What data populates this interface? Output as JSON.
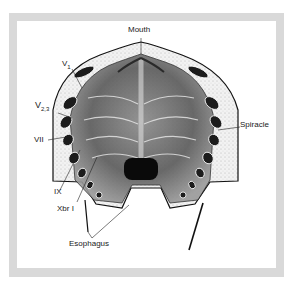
{
  "figure": {
    "frame_color": "#d9d9d9",
    "labels": {
      "mouth": "Mouth",
      "v1": "V",
      "v1_sub": "1",
      "v23": "V",
      "v23_sub": "2,3",
      "vii": "VII",
      "ix": "IX",
      "xbr1": "Xbr I",
      "spiracle": "Spiracle",
      "esophagus": "Esophagus"
    }
  }
}
